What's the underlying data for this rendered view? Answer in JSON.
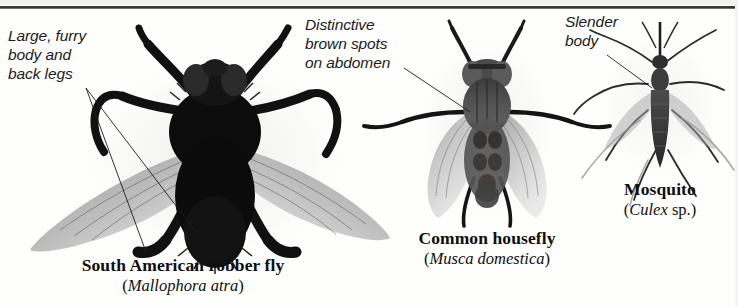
{
  "figure": {
    "background_color": "#fefefd",
    "ink_color": "#1b1b1b"
  },
  "callouts": [
    {
      "id": "robber-fly",
      "text": "Large, furry\nbody and\nback legs",
      "lines": [
        "Large, furry",
        "body and",
        "back legs"
      ],
      "points_to": "robber fly body and hind legs",
      "leader_count": 2
    },
    {
      "id": "housefly",
      "text": "Distinctive\nbrown spots\non abdomen",
      "lines": [
        "Distinctive",
        "brown spots",
        "on abdomen"
      ],
      "points_to": "housefly abdomen",
      "leader_count": 1
    },
    {
      "id": "mosquito",
      "text": "Slender\nbody",
      "lines": [
        "Slender",
        "body"
      ],
      "points_to": "mosquito abdomen",
      "leader_count": 1
    }
  ],
  "specimens": [
    {
      "id": "robber-fly",
      "common_name": "South American robber fly",
      "scientific_name": "Mallophora atra",
      "scientific_display": "(Mallophora atra)",
      "qualifier": ""
    },
    {
      "id": "housefly",
      "common_name": "Common housefly",
      "scientific_name": "Musca domestica",
      "scientific_display": "(Musca domestica)",
      "qualifier": ""
    },
    {
      "id": "mosquito",
      "common_name": "Mosquito",
      "scientific_name": "Culex",
      "scientific_display": "(Culex sp.)",
      "qualifier": "sp."
    }
  ]
}
